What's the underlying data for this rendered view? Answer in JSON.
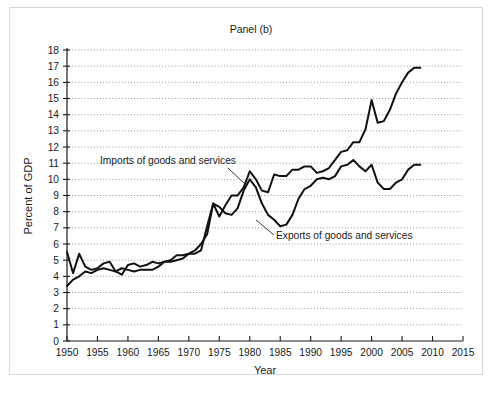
{
  "chart_data": {
    "type": "line",
    "title": "Panel (b)",
    "xlabel": "Year",
    "ylabel": "Percent of GDP",
    "xlim": [
      1950,
      2015
    ],
    "ylim": [
      0,
      18
    ],
    "xticks": [
      1950,
      1955,
      1960,
      1965,
      1970,
      1975,
      1980,
      1985,
      1990,
      1995,
      2000,
      2005,
      2010,
      2015
    ],
    "yticks": [
      0,
      1,
      2,
      3,
      4,
      5,
      6,
      7,
      8,
      9,
      10,
      11,
      12,
      13,
      14,
      15,
      16,
      17,
      18
    ],
    "grid": "horizontal-dotted",
    "legend": "inline-annotations",
    "line_color": "#111111",
    "series": [
      {
        "name": "Exports of goods and services",
        "annotation": "Exports of goods and services",
        "x": [
          1950,
          1951,
          1952,
          1953,
          1954,
          1955,
          1956,
          1957,
          1958,
          1959,
          1960,
          1961,
          1962,
          1963,
          1964,
          1965,
          1966,
          1967,
          1968,
          1969,
          1970,
          1971,
          1972,
          1973,
          1974,
          1975,
          1976,
          1977,
          1978,
          1979,
          1980,
          1981,
          1982,
          1983,
          1984,
          1985,
          1986,
          1987,
          1988,
          1989,
          1990,
          1991,
          1992,
          1993,
          1994,
          1995,
          1996,
          1997,
          1998,
          1999,
          2000,
          2001,
          2002,
          2003,
          2004,
          2005,
          2006,
          2007,
          2008
        ],
        "values": [
          5.5,
          4.2,
          5.4,
          4.6,
          4.4,
          4.5,
          4.8,
          4.9,
          4.3,
          4.1,
          4.7,
          4.8,
          4.6,
          4.7,
          4.9,
          4.8,
          4.9,
          4.9,
          5.0,
          5.1,
          5.4,
          5.4,
          5.6,
          7.1,
          8.5,
          8.3,
          7.9,
          7.8,
          8.2,
          9.3,
          10.0,
          9.5,
          8.5,
          7.8,
          7.5,
          7.1,
          7.2,
          7.8,
          8.8,
          9.4,
          9.6,
          10.0,
          10.1,
          10.0,
          10.2,
          10.8,
          10.9,
          11.2,
          10.8,
          10.5,
          10.9,
          9.8,
          9.4,
          9.4,
          9.8,
          10.0,
          10.6,
          10.9,
          10.9
        ]
      },
      {
        "name": "Imports of goods and services",
        "annotation": "Imports of goods and services",
        "x": [
          1950,
          1951,
          1952,
          1953,
          1954,
          1955,
          1956,
          1957,
          1958,
          1959,
          1960,
          1961,
          1962,
          1963,
          1964,
          1965,
          1966,
          1967,
          1968,
          1969,
          1970,
          1971,
          1972,
          1973,
          1974,
          1975,
          1976,
          1977,
          1978,
          1979,
          1980,
          1981,
          1982,
          1983,
          1984,
          1985,
          1986,
          1987,
          1988,
          1989,
          1990,
          1991,
          1992,
          1993,
          1994,
          1995,
          1996,
          1997,
          1998,
          1999,
          2000,
          2001,
          2002,
          2003,
          2004,
          2005,
          2006,
          2007,
          2008
        ],
        "values": [
          3.4,
          3.8,
          4.0,
          4.3,
          4.2,
          4.4,
          4.5,
          4.4,
          4.3,
          4.5,
          4.4,
          4.3,
          4.4,
          4.4,
          4.4,
          4.6,
          4.9,
          5.0,
          5.3,
          5.3,
          5.4,
          5.6,
          6.0,
          6.6,
          8.5,
          7.7,
          8.4,
          9.0,
          9.0,
          9.5,
          10.5,
          10.0,
          9.3,
          9.2,
          10.3,
          10.2,
          10.2,
          10.6,
          10.6,
          10.8,
          10.8,
          10.4,
          10.5,
          10.7,
          11.2,
          11.7,
          11.8,
          12.3,
          12.3,
          13.1,
          14.9,
          13.5,
          13.6,
          14.3,
          15.3,
          16.0,
          16.6,
          16.9,
          16.9
        ]
      }
    ]
  },
  "figure": {
    "title": "Panel (b)",
    "x_axis_title": "Year",
    "y_axis_title": "Percent of GDP",
    "annotations": [
      {
        "id": "imports",
        "text": "Imports of goods and services"
      },
      {
        "id": "exports",
        "text": "Exports of goods and services"
      }
    ]
  }
}
